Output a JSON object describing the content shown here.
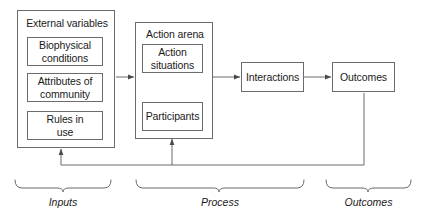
{
  "diagram": {
    "colors": {
      "background": "#ffffff",
      "stroke": "#6b6b6b",
      "text": "#1a1a1a",
      "arrow": "#4a4a4a"
    },
    "containers": [
      {
        "id": "external-variables",
        "label": "External variables"
      },
      {
        "id": "action-arena",
        "label": "Action arena"
      }
    ],
    "boxes": [
      {
        "id": "biophysical-conditions",
        "line1": "Biophysical",
        "line2": "conditions"
      },
      {
        "id": "attributes-of-community",
        "line1": "Attributes of",
        "line2": "community"
      },
      {
        "id": "rules-in-use",
        "line1": "Rules in",
        "line2": "use"
      },
      {
        "id": "action-situations",
        "line1": "Action",
        "line2": "situations"
      },
      {
        "id": "participants",
        "line1": "Participants",
        "line2": ""
      },
      {
        "id": "interactions",
        "line1": "Interactions",
        "line2": ""
      },
      {
        "id": "outcomes",
        "line1": "Outcomes",
        "line2": ""
      }
    ],
    "phases": [
      {
        "id": "inputs",
        "label": "Inputs"
      },
      {
        "id": "process",
        "label": "Process"
      },
      {
        "id": "outcomes",
        "label": "Outcomes"
      }
    ]
  }
}
